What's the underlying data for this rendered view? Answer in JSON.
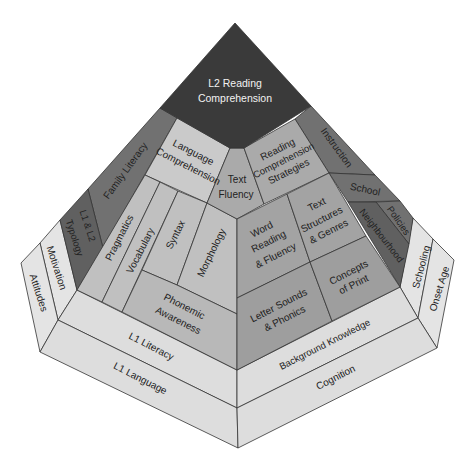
{
  "diagram": {
    "apex": {
      "lines": [
        "L2 Reading",
        "Comprehension"
      ]
    },
    "center": {
      "language_comprehension": [
        "Language",
        "Comprehension"
      ],
      "text_fluency": [
        "Text",
        "Fluency"
      ],
      "reading_comprehension_strategies": [
        "Reading",
        "Comprehension",
        "Strategies"
      ]
    },
    "left_bands": {
      "family_literacy": "Family Literacy",
      "typology": [
        "L1 & L2",
        "Typology"
      ]
    },
    "right_bands": {
      "instruction": "Instruction",
      "school": "School",
      "policies": "Policies",
      "neighbourhood": "Neighbourhood"
    },
    "left_face": {
      "pragmatics": "Pragmatics",
      "vocabulary": "Vocabulary",
      "syntax": "Syntax",
      "morphology": "Morphology",
      "phonemic_awareness": [
        "Phonemic",
        "Awareness"
      ]
    },
    "right_face": {
      "word_reading_fluency": [
        "Word",
        "Reading",
        "& Fluency"
      ],
      "text_structures_genres": [
        "Text",
        "Structures",
        "& Genres"
      ],
      "letter_sounds_phonics": [
        "Letter Sounds",
        "& Phonics"
      ],
      "concepts_of_print": [
        "Concepts",
        "of Print"
      ]
    },
    "base": {
      "l1_literacy": "L1 Literacy",
      "l1_language": "L1 Language",
      "background_knowledge": "Background Knowledge",
      "cognition": "Cognition",
      "motivation": "Motivation",
      "attitudes": "Attitudes",
      "schooling": "Schooling",
      "onset_age": "Onset Age"
    },
    "colors": {
      "dark": "#3a3a3a",
      "band": "#717171",
      "band2": "#606060",
      "tile-lc": "#cacaca",
      "tile-l": "#c0c0c0",
      "tile-pa": "#b8b8b8",
      "tile-c": "#aaaaaa",
      "tile-r": "#a3a3a3",
      "tile-r2": "#9e9e9e",
      "base-front": "#dddddd",
      "base-side": "#e4e4e4"
    }
  }
}
